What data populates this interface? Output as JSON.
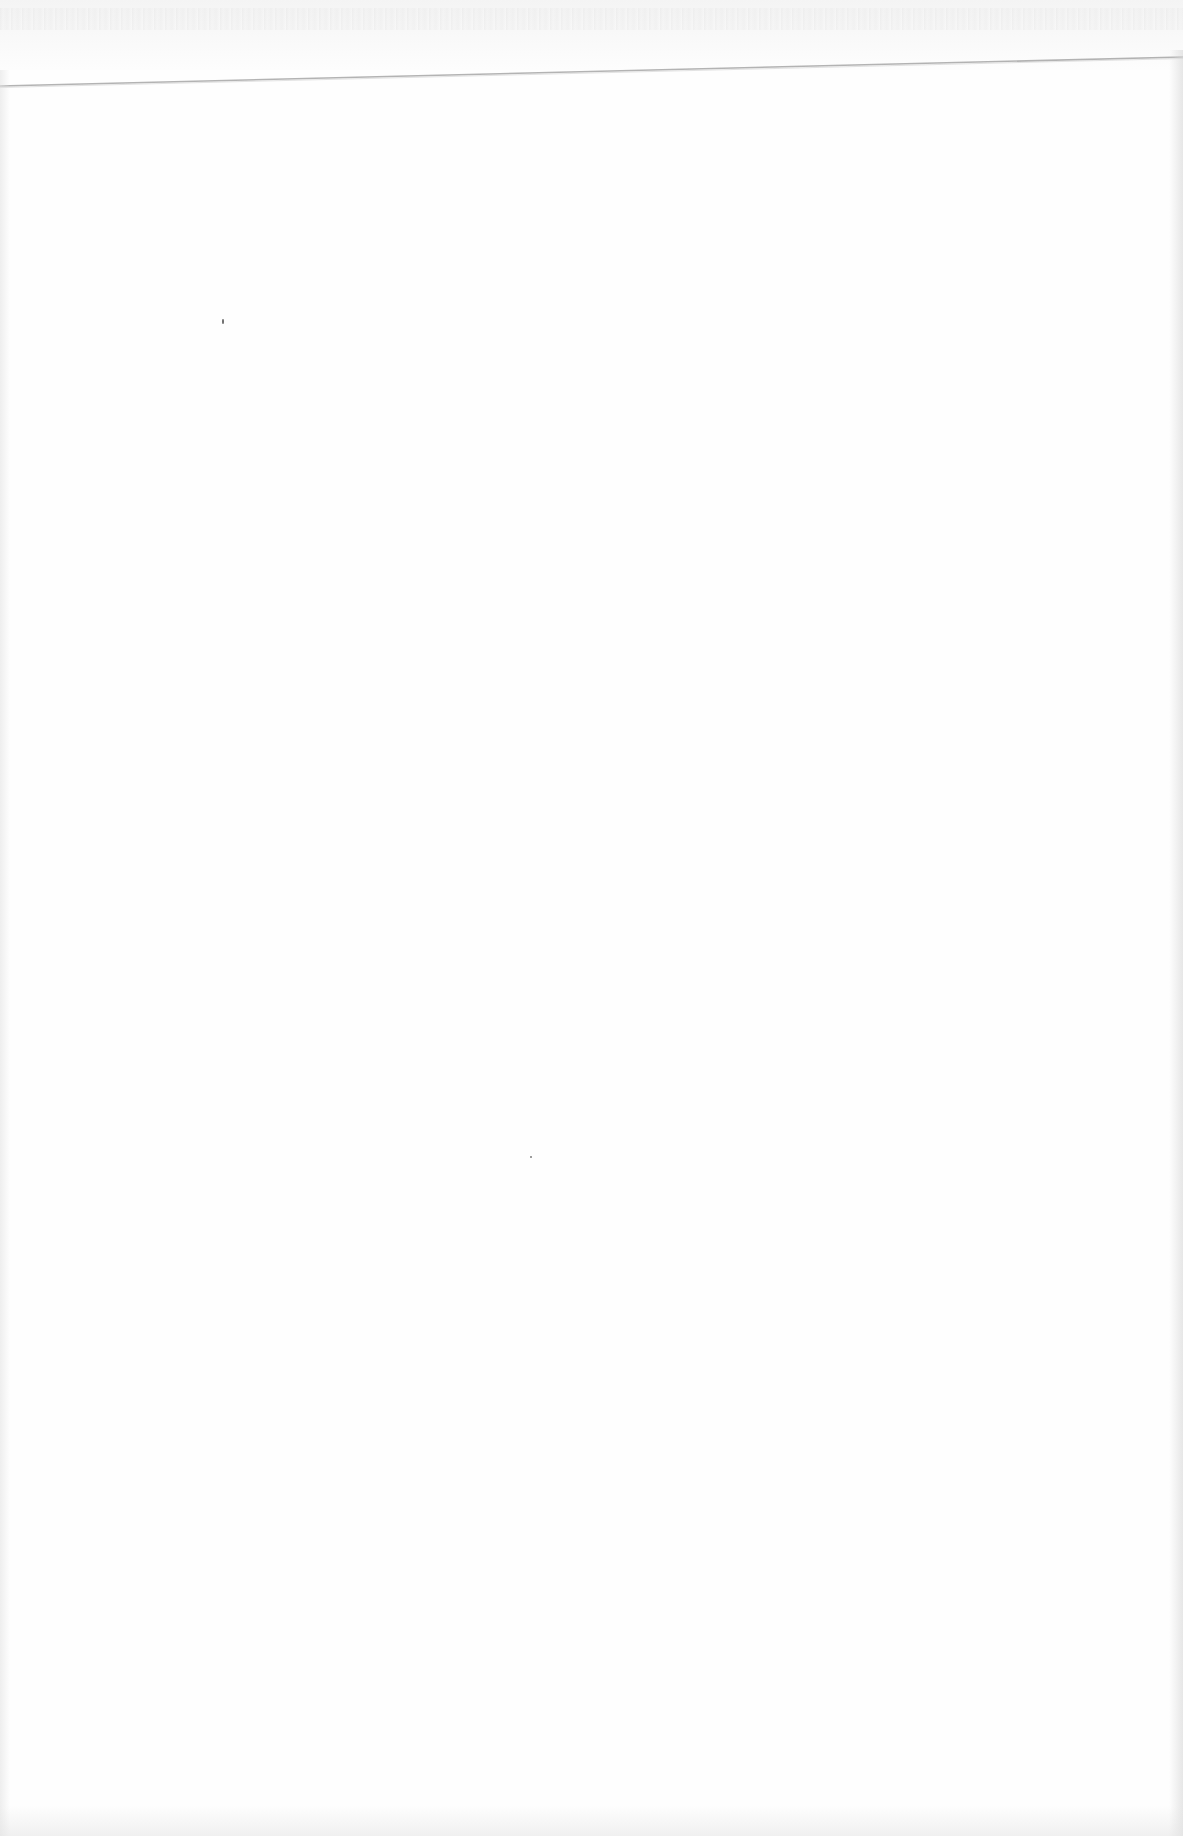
{
  "document": {
    "type": "blank scanned page",
    "text_content": "",
    "colors": {
      "paper": "#fefefe",
      "edge_line": "#9a9a9a",
      "scan_noise": "#f3f3f3",
      "speck": "#6f6f6f"
    },
    "edge_line": {
      "left_y": 86,
      "right_y": 57
    },
    "specks": [
      {
        "x": 222,
        "y": 321
      },
      {
        "x": 530,
        "y": 1157
      }
    ]
  }
}
